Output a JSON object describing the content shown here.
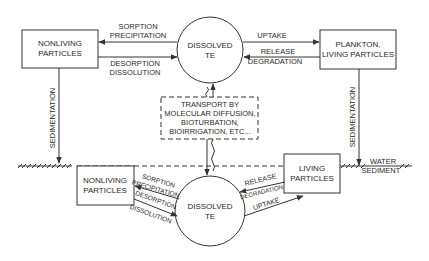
{
  "diagram": {
    "type": "flow",
    "colors": {
      "line": "#333333",
      "text": "#2a2a2a",
      "background": "#ffffff"
    },
    "water_column": {
      "nonliving": {
        "line1": "NONLIVING",
        "line2": "PARTICLES"
      },
      "dissolved": {
        "line1": "DISSOLVED",
        "line2": "TE"
      },
      "plankton": {
        "line1": "PLANKTON,",
        "line2": "LIVING PARTICLES"
      },
      "arrows": {
        "sorption": "SORPTION",
        "precipitation": "PRECIPITATION",
        "desorption": "DESORPTION",
        "dissolution": "DISSOLUTION",
        "uptake": "UPTAKE",
        "release": "RELEASE",
        "degradation": "DEGRADATION"
      },
      "sedimentation_left": "SEDIMENTATION",
      "sedimentation_right": "SEDIMENTATION"
    },
    "transport": {
      "line1": "TRANSPORT BY",
      "line2": "MOLECULAR DIFFUSION,",
      "line3": "BIOTURBATION,",
      "line4": "BIOIRRIGATION, ETC..."
    },
    "interface": {
      "water": "WATER",
      "sediment": "SEDIMENT"
    },
    "sediment": {
      "nonliving": {
        "line1": "NONLIVING",
        "line2": "PARTICLES"
      },
      "dissolved": {
        "line1": "DISSOLVED",
        "line2": "TE"
      },
      "living": {
        "line1": "LIVING",
        "line2": "PARTICLES"
      },
      "arrows": {
        "sorption": "SORPTION",
        "precipitation": "PRECIPITATION",
        "desorption": "DESORPTION",
        "dissolution": "DISSOLUTION",
        "release": "RELEASE",
        "degradation": "DEGRADATION",
        "uptake": "UPTAKE"
      }
    }
  }
}
